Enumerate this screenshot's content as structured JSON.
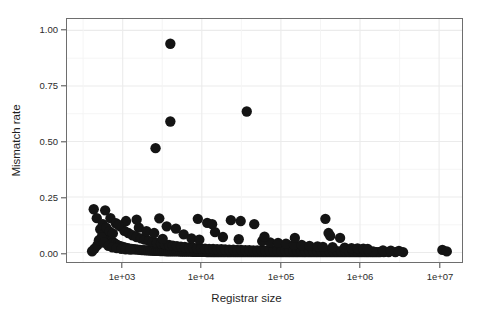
{
  "chart_data": {
    "type": "scatter",
    "title": "",
    "xlabel": "Registrar size",
    "ylabel": "Mismatch rate",
    "x_scale": "log10",
    "y_scale": "linear",
    "xlim": [
      300,
      20000000
    ],
    "ylim": [
      -0.04,
      1.06
    ],
    "grid": true,
    "grid_color": "#ebebeb",
    "panel_background": "#ffffff",
    "panel_border_color": "#6e6e6e",
    "point_color": "#141414",
    "point_radius_px": 5.2,
    "legend": null,
    "xticks": [
      1000,
      10000,
      100000,
      1000000,
      10000000
    ],
    "xtick_labels": [
      "1e+03",
      "1e+04",
      "1e+05",
      "1e+06",
      "1e+07"
    ],
    "yticks": [
      0.0,
      0.25,
      0.5,
      0.75,
      1.0
    ],
    "ytick_labels": [
      "0.00",
      "0.25",
      "0.50",
      "0.75",
      "1.00"
    ],
    "n_points": 268,
    "annotations": [],
    "outliers": [
      {
        "x": 4000,
        "y": 0.94
      },
      {
        "x": 4000,
        "y": 0.59
      },
      {
        "x": 2600,
        "y": 0.47
      },
      {
        "x": 37000,
        "y": 0.635
      }
    ],
    "points": [
      [
        4000,
        0.94
      ],
      [
        4000,
        0.59
      ],
      [
        2600,
        0.47
      ],
      [
        37000,
        0.635
      ],
      [
        430,
        0.195
      ],
      [
        470,
        0.155
      ],
      [
        520,
        0.105
      ],
      [
        560,
        0.082
      ],
      [
        600,
        0.19
      ],
      [
        640,
        0.072
      ],
      [
        690,
        0.061
      ],
      [
        720,
        0.052
      ],
      [
        760,
        0.046
      ],
      [
        800,
        0.04
      ],
      [
        850,
        0.035
      ],
      [
        900,
        0.03
      ],
      [
        960,
        0.028
      ],
      [
        1020,
        0.024
      ],
      [
        1080,
        0.022
      ],
      [
        1150,
        0.02
      ],
      [
        1220,
        0.018
      ],
      [
        1300,
        0.016
      ],
      [
        1380,
        0.015
      ],
      [
        1460,
        0.014
      ],
      [
        1550,
        0.013
      ],
      [
        1650,
        0.012
      ],
      [
        1750,
        0.011
      ],
      [
        1860,
        0.011
      ],
      [
        1970,
        0.01
      ],
      [
        2100,
        0.01
      ],
      [
        2230,
        0.009
      ],
      [
        2360,
        0.009
      ],
      [
        2500,
        0.008
      ],
      [
        2660,
        0.008
      ],
      [
        2820,
        0.008
      ],
      [
        3000,
        0.007
      ],
      [
        3180,
        0.007
      ],
      [
        3370,
        0.007
      ],
      [
        3580,
        0.006
      ],
      [
        3800,
        0.006
      ],
      [
        4030,
        0.006
      ],
      [
        4270,
        0.005
      ],
      [
        4530,
        0.005
      ],
      [
        4800,
        0.005
      ],
      [
        5100,
        0.005
      ],
      [
        5400,
        0.004
      ],
      [
        5730,
        0.004
      ],
      [
        6080,
        0.004
      ],
      [
        6450,
        0.004
      ],
      [
        6840,
        0.004
      ],
      [
        7250,
        0.004
      ],
      [
        7690,
        0.003
      ],
      [
        8160,
        0.003
      ],
      [
        8650,
        0.003
      ],
      [
        9180,
        0.003
      ],
      [
        9730,
        0.003
      ],
      [
        10300,
        0.003
      ],
      [
        11000,
        0.003
      ],
      [
        11600,
        0.002
      ],
      [
        12300,
        0.002
      ],
      [
        13100,
        0.002
      ],
      [
        13900,
        0.002
      ],
      [
        14700,
        0.002
      ],
      [
        15600,
        0.002
      ],
      [
        16500,
        0.002
      ],
      [
        17500,
        0.002
      ],
      [
        18600,
        0.002
      ],
      [
        19700,
        0.002
      ],
      [
        21000,
        0.002
      ],
      [
        22200,
        0.002
      ],
      [
        23500,
        0.002
      ],
      [
        25000,
        0.002
      ],
      [
        26500,
        0.002
      ],
      [
        28100,
        0.002
      ],
      [
        29800,
        0.002
      ],
      [
        31600,
        0.002
      ],
      [
        33500,
        0.002
      ],
      [
        35500,
        0.002
      ],
      [
        37700,
        0.002
      ],
      [
        40000,
        0.002
      ],
      [
        42400,
        0.002
      ],
      [
        45000,
        0.002
      ],
      [
        47700,
        0.002
      ],
      [
        50600,
        0.002
      ],
      [
        53600,
        0.002
      ],
      [
        56800,
        0.002
      ],
      [
        60300,
        0.002
      ],
      [
        63900,
        0.002
      ],
      [
        67800,
        0.002
      ],
      [
        71900,
        0.002
      ],
      [
        76200,
        0.002
      ],
      [
        80800,
        0.002
      ],
      [
        85700,
        0.002
      ],
      [
        90800,
        0.002
      ],
      [
        96300,
        0.002
      ],
      [
        102000,
        0.002
      ],
      [
        108000,
        0.002
      ],
      [
        115000,
        0.002
      ],
      [
        122000,
        0.002
      ],
      [
        129000,
        0.002
      ],
      [
        137000,
        0.002
      ],
      [
        145000,
        0.002
      ],
      [
        154000,
        0.002
      ],
      [
        163000,
        0.002
      ],
      [
        173000,
        0.002
      ],
      [
        184000,
        0.002
      ],
      [
        195000,
        0.002
      ],
      [
        206000,
        0.002
      ],
      [
        219000,
        0.002
      ],
      [
        232000,
        0.002
      ],
      [
        246000,
        0.002
      ],
      [
        261000,
        0.002
      ],
      [
        277000,
        0.002
      ],
      [
        293000,
        0.002
      ],
      [
        311000,
        0.002
      ],
      [
        330000,
        0.002
      ],
      [
        350000,
        0.002
      ],
      [
        371000,
        0.002
      ],
      [
        393000,
        0.002
      ],
      [
        417000,
        0.002
      ],
      [
        442000,
        0.002
      ],
      [
        469000,
        0.002
      ],
      [
        497000,
        0.002
      ],
      [
        527000,
        0.002
      ],
      [
        559000,
        0.002
      ],
      [
        593000,
        0.002
      ],
      [
        629000,
        0.002
      ],
      [
        666000,
        0.002
      ],
      [
        707000,
        0.002
      ],
      [
        749000,
        0.002
      ],
      [
        794000,
        0.002
      ],
      [
        842000,
        0.002
      ],
      [
        893000,
        0.002
      ],
      [
        947000,
        0.002
      ],
      [
        1000000,
        0.002
      ],
      [
        1060000,
        0.002
      ],
      [
        1130000,
        0.002
      ],
      [
        1200000,
        0.002
      ],
      [
        1270000,
        0.002
      ],
      [
        1350000,
        0.002
      ],
      [
        1430000,
        0.002
      ],
      [
        1510000,
        0.002
      ],
      [
        1600000,
        0.002
      ],
      [
        1700000,
        0.002
      ],
      [
        1800000,
        0.002
      ],
      [
        2000000,
        0.002
      ],
      [
        2300000,
        0.002
      ],
      [
        2800000,
        0.002
      ],
      [
        3500000,
        0.002
      ],
      [
        11000000,
        0.012
      ],
      [
        12500000,
        0.005
      ],
      [
        700,
        0.155
      ],
      [
        820,
        0.132
      ],
      [
        930,
        0.118
      ],
      [
        1050,
        0.098
      ],
      [
        1180,
        0.088
      ],
      [
        1330,
        0.078
      ],
      [
        1500,
        0.07
      ],
      [
        1700,
        0.064
      ],
      [
        1900,
        0.058
      ],
      [
        2150,
        0.053
      ],
      [
        2400,
        0.048
      ],
      [
        2700,
        0.044
      ],
      [
        3050,
        0.04
      ],
      [
        3400,
        0.037
      ],
      [
        3850,
        0.034
      ],
      [
        4300,
        0.031
      ],
      [
        4850,
        0.029
      ],
      [
        5450,
        0.027
      ],
      [
        6100,
        0.025
      ],
      [
        6900,
        0.023
      ],
      [
        7750,
        0.022
      ],
      [
        8700,
        0.02
      ],
      [
        9800,
        0.019
      ],
      [
        11000,
        0.018
      ],
      [
        12400,
        0.017
      ],
      [
        13900,
        0.016
      ],
      [
        15600,
        0.015
      ],
      [
        17600,
        0.015
      ],
      [
        19700,
        0.014
      ],
      [
        22200,
        0.013
      ],
      [
        25000,
        0.013
      ],
      [
        28000,
        0.012
      ],
      [
        31500,
        0.012
      ],
      [
        35500,
        0.011
      ],
      [
        39800,
        0.011
      ],
      [
        44700,
        0.01
      ],
      [
        50200,
        0.01
      ],
      [
        56400,
        0.01
      ],
      [
        63400,
        0.009
      ],
      [
        71200,
        0.009
      ],
      [
        80000,
        0.009
      ],
      [
        89800,
        0.009
      ],
      [
        101000,
        0.008
      ],
      [
        113000,
        0.008
      ],
      [
        127000,
        0.008
      ],
      [
        143000,
        0.008
      ],
      [
        160000,
        0.008
      ],
      [
        180000,
        0.007
      ],
      [
        202000,
        0.007
      ],
      [
        227000,
        0.007
      ],
      [
        255000,
        0.007
      ],
      [
        287000,
        0.007
      ],
      [
        322000,
        0.007
      ],
      [
        362000,
        0.006
      ],
      [
        406000,
        0.006
      ],
      [
        456000,
        0.006
      ],
      [
        512000,
        0.006
      ],
      [
        575000,
        0.006
      ],
      [
        646000,
        0.006
      ],
      [
        726000,
        0.005
      ],
      [
        815000,
        0.005
      ],
      [
        915000,
        0.005
      ],
      [
        1030000,
        0.005
      ],
      [
        1150000,
        0.005
      ],
      [
        1300000,
        0.005
      ],
      [
        1460000,
        0.005
      ],
      [
        560,
        0.128
      ],
      [
        620,
        0.112
      ],
      [
        680,
        0.095
      ],
      [
        750,
        0.086
      ],
      [
        1600,
        0.112
      ],
      [
        2000,
        0.096
      ],
      [
        2500,
        0.088
      ],
      [
        3200,
        0.062
      ],
      [
        4700,
        0.108
      ],
      [
        5900,
        0.082
      ],
      [
        7400,
        0.064
      ],
      [
        9300,
        0.058
      ],
      [
        11700,
        0.134
      ],
      [
        14700,
        0.092
      ],
      [
        18500,
        0.07
      ],
      [
        23300,
        0.146
      ],
      [
        29300,
        0.06
      ],
      [
        46000,
        0.128
      ],
      [
        58000,
        0.052
      ],
      [
        73000,
        0.046
      ],
      [
        92000,
        0.044
      ],
      [
        116000,
        0.04
      ],
      [
        146000,
        0.036
      ],
      [
        183000,
        0.034
      ],
      [
        230000,
        0.03
      ],
      [
        290000,
        0.028
      ],
      [
        365000,
        0.152
      ],
      [
        400000,
        0.088
      ],
      [
        420000,
        0.075
      ],
      [
        560000,
        0.066
      ],
      [
        640000,
        0.022
      ],
      [
        780000,
        0.02
      ],
      [
        930000,
        0.019
      ],
      [
        1100000,
        0.018
      ],
      [
        1250000,
        0.017
      ],
      [
        1500,
        0.148
      ],
      [
        1100,
        0.142
      ],
      [
        890,
        0.125
      ],
      [
        2900,
        0.154
      ],
      [
        3600,
        0.118
      ],
      [
        8900,
        0.152
      ],
      [
        13500,
        0.128
      ],
      [
        31000,
        0.142
      ],
      [
        62000,
        0.072
      ],
      [
        150000,
        0.066
      ],
      [
        340000,
        0.026
      ],
      [
        450000,
        0.024
      ],
      [
        1950000,
        0.01
      ],
      [
        2450000,
        0.009
      ],
      [
        3100000,
        0.008
      ],
      [
        410,
        0.006
      ],
      [
        440,
        0.018
      ],
      [
        480,
        0.034
      ],
      [
        500,
        0.056
      ],
      [
        540,
        0.068
      ],
      [
        580,
        0.045
      ],
      [
        660,
        0.03
      ],
      [
        740,
        0.024
      ],
      [
        840,
        0.02
      ],
      [
        960,
        0.017
      ],
      [
        1090,
        0.015
      ],
      [
        1240,
        0.013
      ]
    ]
  },
  "axes": {
    "ylabel": "Mismatch rate",
    "xlabel": "Registrar size",
    "ytick_labels": [
      "1.00",
      "0.75",
      "0.50",
      "0.25",
      "0.00"
    ],
    "xtick_labels": [
      "1e+03",
      "1e+04",
      "1e+05",
      "1e+06",
      "1e+07"
    ]
  }
}
